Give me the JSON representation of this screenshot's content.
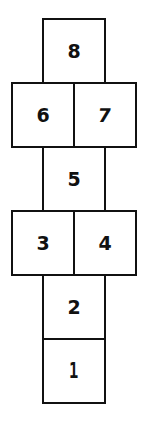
{
  "diagram": {
    "type": "hopscotch-court",
    "line_color": "#111111",
    "background_color": "#ffffff",
    "rows": [
      {
        "row": 1,
        "squares": [
          {
            "label": "8"
          }
        ]
      },
      {
        "row": 2,
        "squares": [
          {
            "label": "6"
          },
          {
            "label": "7"
          }
        ]
      },
      {
        "row": 3,
        "squares": [
          {
            "label": "5"
          }
        ]
      },
      {
        "row": 4,
        "squares": [
          {
            "label": "3"
          },
          {
            "label": "4"
          }
        ]
      },
      {
        "row": 5,
        "squares": [
          {
            "label": "2"
          }
        ]
      },
      {
        "row": 6,
        "squares": [
          {
            "label": "1"
          }
        ]
      }
    ]
  }
}
